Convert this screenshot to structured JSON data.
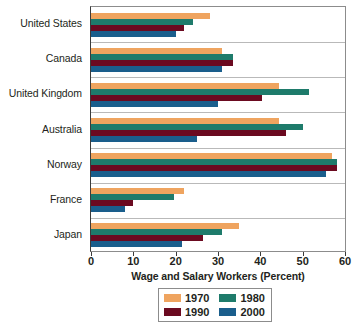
{
  "chart_data": {
    "type": "bar",
    "orientation": "horizontal",
    "title": "",
    "xlabel": "Wage and Salary Workers (Percent)",
    "ylabel": "",
    "xlim": [
      0,
      60
    ],
    "xticks": [
      0,
      10,
      20,
      30,
      40,
      50,
      60
    ],
    "xtick_labels": [
      "0",
      "10",
      "20",
      "30",
      "40",
      "50",
      "60"
    ],
    "grid": true,
    "legend_position": "bottom-center",
    "categories": [
      "United States",
      "Canada",
      "United Kingdom",
      "Australia",
      "Norway",
      "France",
      "Japan"
    ],
    "series": [
      {
        "name": "1970",
        "color": "#efa45f",
        "values": [
          28,
          31,
          44.5,
          44.5,
          57,
          22,
          35
        ]
      },
      {
        "name": "1980",
        "color": "#1e7b6b",
        "values": [
          24,
          33.5,
          51.5,
          50,
          58,
          19.5,
          31
        ]
      },
      {
        "name": "1990",
        "color": "#6b0a20",
        "values": [
          22,
          33.5,
          40.5,
          46,
          58,
          10,
          26.5
        ]
      },
      {
        "name": "2000",
        "color": "#1a5e8c",
        "values": [
          20,
          31,
          30,
          25,
          55.5,
          8,
          21.5
        ]
      }
    ]
  },
  "legend": {
    "entries": [
      {
        "label": "1970",
        "color": "#efa45f"
      },
      {
        "label": "1980",
        "color": "#1e7b6b"
      },
      {
        "label": "1990",
        "color": "#6b0a20"
      },
      {
        "label": "2000",
        "color": "#1a5e8c"
      }
    ]
  },
  "axis": {
    "x_title": "Wage and Salary Workers (Percent)"
  }
}
